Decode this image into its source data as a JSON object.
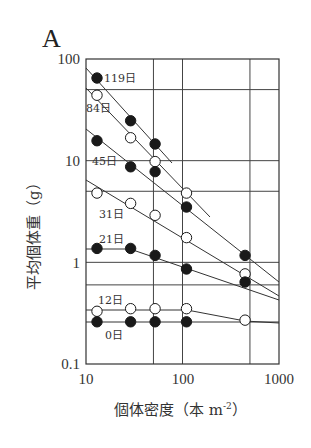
{
  "chart_data": {
    "type": "scatter",
    "panel": "A",
    "title": "",
    "xlabel": "個体密度（本 m⁻²）",
    "xlabel_parts": {
      "main": "個体密度（本 m",
      "sup": "-2",
      "close": "）"
    },
    "ylabel": "平均個体重（g）",
    "xscale": "log",
    "yscale": "log",
    "xlim": [
      10,
      1000
    ],
    "ylim": [
      0.1,
      100
    ],
    "x_ticks": [
      "10",
      "100",
      "1000"
    ],
    "y_ticks": [
      "100",
      "10",
      "1",
      "0.1"
    ],
    "grid": true,
    "x_gridlines": [
      50,
      100,
      500
    ],
    "y_gridlines": [
      50,
      10,
      5,
      1,
      0.6
    ],
    "legend": "inline labels",
    "series": [
      {
        "name": "119日",
        "marker": "filled",
        "x": [
          13,
          29,
          52
        ],
        "y": [
          65,
          24.7,
          14.6
        ]
      },
      {
        "name": "84日",
        "marker": "open",
        "x": [
          13,
          29,
          52,
          110
        ],
        "y": [
          44,
          16.8,
          9.8,
          4.8
        ]
      },
      {
        "name": "45日",
        "marker": "filled",
        "x": [
          13,
          29,
          52,
          110,
          445
        ],
        "y": [
          15.7,
          8.7,
          7.8,
          3.5,
          1.17
        ]
      },
      {
        "name": "31日",
        "marker": "open",
        "x": [
          13,
          29,
          52,
          110,
          445
        ],
        "y": [
          4.8,
          3.8,
          2.9,
          1.75,
          0.77
        ]
      },
      {
        "name": "21日",
        "marker": "filled",
        "x": [
          13,
          29,
          52,
          110,
          445
        ],
        "y": [
          1.37,
          1.37,
          1.17,
          0.86,
          0.64
        ]
      },
      {
        "name": "12日",
        "marker": "open",
        "x": [
          13,
          29,
          52,
          110,
          445
        ],
        "y": [
          0.33,
          0.35,
          0.35,
          0.35,
          0.27
        ]
      },
      {
        "name": "0日",
        "marker": "filled",
        "x": [
          13,
          29,
          52,
          110
        ],
        "y": [
          0.26,
          0.26,
          0.26,
          0.26
        ]
      }
    ]
  },
  "labels": {
    "panel": "A",
    "y_tick_100": "100",
    "y_tick_10": "10",
    "y_tick_1": "1",
    "y_tick_01": "0.1",
    "x_tick_10": "10",
    "x_tick_100": "100",
    "x_tick_1000": "1000",
    "ylabel": "平均個体重（g）",
    "xlabel_main": "個体密度（本 m",
    "xlabel_sup": "-2",
    "xlabel_close": "）"
  }
}
